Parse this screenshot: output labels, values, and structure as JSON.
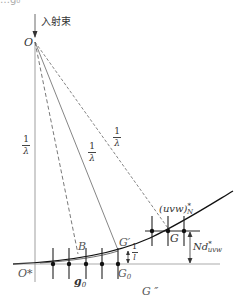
{
  "top_fragment": "…g₀",
  "incident_beam": {
    "label": "入射束"
  },
  "points": {
    "origin": "O",
    "reciprocal_origin": "O*",
    "B": "B",
    "G_prime": "G′",
    "G0": "G",
    "G0_sub": "0",
    "G": "G",
    "G_double_prime": "G ″"
  },
  "radius_labels": [
    {
      "num": "1",
      "den": "λ"
    },
    {
      "num": "1",
      "den": "λ"
    },
    {
      "num": "1",
      "den": "λ"
    }
  ],
  "spacing_label": {
    "num": "1",
    "den": "l"
  },
  "plane_label": {
    "main": "(uvw)",
    "sup": "*",
    "sub": "N"
  },
  "height_label": {
    "main": "Nd",
    "sup": "*",
    "sub": "uvw"
  },
  "vector_label": {
    "main": "g",
    "sub": "0"
  },
  "colors": {
    "line": "#333333",
    "curve": "#111111",
    "background": "#ffffff"
  }
}
